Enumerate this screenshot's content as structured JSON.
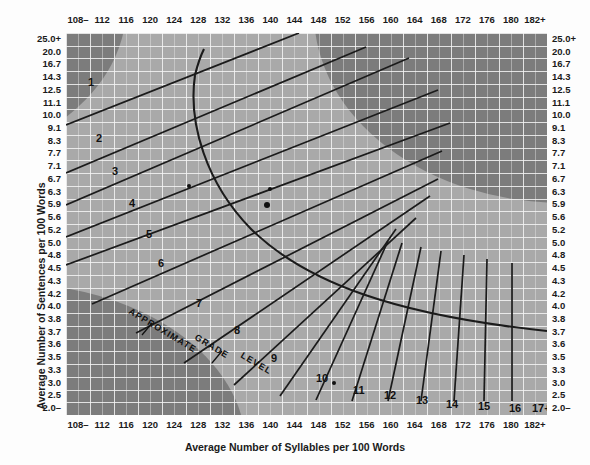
{
  "chart_data": {
    "type": "line",
    "xlabel": "Average Number of Syllables per 100 Words",
    "ylabel": "Average Number of Sentences per 100 Words",
    "x_ticks": [
      "108–",
      "112",
      "116",
      "120",
      "124",
      "128",
      "132",
      "136",
      "140",
      "144",
      "148",
      "152",
      "156",
      "160",
      "164",
      "168",
      "172",
      "176",
      "180",
      "182+"
    ],
    "y_ticks": [
      "25.0+",
      "20.0",
      "16.7",
      "14.3",
      "12.5",
      "11.1",
      "10.0",
      "9.1",
      "8.3",
      "7.7",
      "7.1",
      "6.7",
      "6.3",
      "5.9",
      "5.6",
      "5.2",
      "5.0",
      "4.8",
      "4.5",
      "4.3",
      "4.2",
      "4.0",
      "3.8",
      "3.7",
      "3.6",
      "3.5",
      "3.3",
      "3.0",
      "2.5",
      "2.0–"
    ],
    "grid": true,
    "legend_position": "none",
    "annotation": "APPROXIMATE GRADE LEVEL",
    "grade_labels": [
      "1",
      "2",
      "3",
      "4",
      "5",
      "6",
      "7",
      "8",
      "9",
      "10",
      "11",
      "12",
      "13",
      "14",
      "15",
      "16",
      "17+"
    ],
    "data_points": [
      {
        "x": 126.5,
        "y": 6.5
      },
      {
        "x": 140.0,
        "y": 6.4
      },
      {
        "x": 139.5,
        "y": 5.9
      },
      {
        "x": 150.5,
        "y": 3.0
      }
    ],
    "shaded_regions": [
      "upper-right long words invalid",
      "lower-left long sentences invalid",
      "upper-left corner"
    ],
    "colors": {
      "plot_background": "#a9a9a9",
      "shaded_region": "#7c7c7c",
      "gridline": "#f5f5f5",
      "curve": "#1b1b1b",
      "text": "#1a1a1a",
      "page_background": "#fdfdfd"
    }
  },
  "axes": {
    "x_title": "Average Number of Syllables per 100 Words",
    "y_title": "Average Number of Sentences per 100 Words"
  },
  "annotation": {
    "line1": "APPROXIMATE",
    "line2": "GRADE",
    "line3": "LEVEL"
  }
}
